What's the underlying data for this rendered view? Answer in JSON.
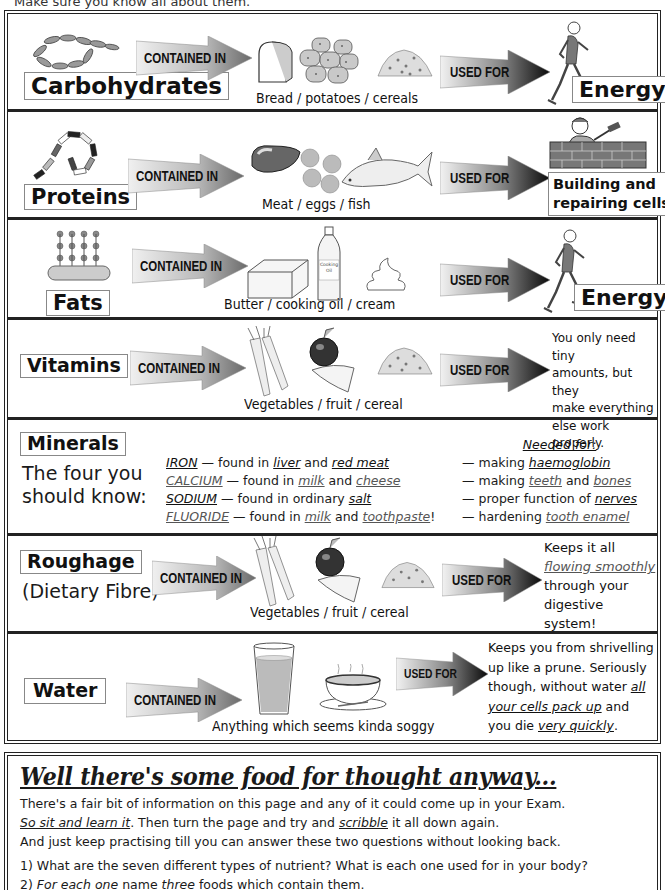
{
  "intro": "Make sure you know all about them.",
  "arrows": {
    "contained_in": "CONTAINED IN",
    "used_for": "USED FOR"
  },
  "rows": {
    "carbohydrates": {
      "name": "Carbohydrates",
      "foods": "Bread / potatoes / cereals",
      "use": "Energy",
      "icons": [
        "glucose-chain-icon",
        "bread-icon",
        "potatoes-icon",
        "cereal-icon",
        "runner-icon"
      ]
    },
    "proteins": {
      "name": "Proteins",
      "foods": "Meat / eggs / fish",
      "use_line1": "Building and",
      "use_line2": "repairing cells",
      "icons": [
        "amino-acid-chain-icon",
        "meat-icon",
        "eggs-icon",
        "fish-icon",
        "bricklayer-icon"
      ]
    },
    "fats": {
      "name": "Fats",
      "foods": "Butter / cooking oil / cream",
      "use": "Energy",
      "oil_label_1": "Cooking",
      "oil_label_2": "Oil",
      "icons": [
        "fat-molecule-icon",
        "butter-icon",
        "cooking-oil-bottle-icon",
        "cream-icon",
        "runner-icon"
      ]
    },
    "vitamins": {
      "name": "Vitamins",
      "foods": "Vegetables / fruit / cereal",
      "use_lines": [
        "You only need tiny",
        "amounts, but they",
        "make everything",
        "else work properly."
      ],
      "icons": [
        "vegetables-icon",
        "fruit-icon",
        "cereal-icon"
      ]
    },
    "minerals": {
      "name": "Minerals",
      "sub_line1": "The four you",
      "sub_line2": "should know:",
      "needed_for_heading": "Needed for:",
      "items": [
        {
          "mineral": "IRON",
          "mid": " — found in ",
          "food1": "liver",
          "and": " and ",
          "food2": "red meat",
          "end": "",
          "need_prefix": "— making ",
          "need1": "haemoglobin",
          "need_and": "",
          "need2": ""
        },
        {
          "mineral": "CALCIUM",
          "mid": " — found in ",
          "food1": "milk",
          "and": " and ",
          "food2": "cheese",
          "end": "",
          "need_prefix": "— making ",
          "need1": "teeth",
          "need_and": " and ",
          "need2": "bones"
        },
        {
          "mineral": "SODIUM",
          "mid": " — found in ordinary ",
          "food1": "salt",
          "and": "",
          "food2": "",
          "end": "",
          "need_prefix": "— proper function of ",
          "need1": "nerves",
          "need_and": "",
          "need2": ""
        },
        {
          "mineral": "FLUORIDE",
          "mid": " — found in ",
          "food1": "milk",
          "and": " and ",
          "food2": "toothpaste",
          "end": "!",
          "need_prefix": "— hardening ",
          "need1": "tooth enamel",
          "need_and": "",
          "need2": ""
        }
      ]
    },
    "roughage": {
      "name": "Roughage",
      "sub": "(Dietary Fibre)",
      "foods": "Vegetables / fruit / cereal",
      "use_line1": "Keeps it all",
      "use_line2": "flowing smoothly",
      "use_line3": "through your",
      "use_line4": "digestive system!"
    },
    "water": {
      "name": "Water",
      "foods": "Anything which seems kinda soggy",
      "use_line1": "Keeps you from shrivelling",
      "use_line2": "up like a prune.  Seriously",
      "use_line3a": "though, without water ",
      "use_line3b": "all",
      "use_line4a": "your cells pack up",
      "use_line4b": " and",
      "use_line5a": "you die ",
      "use_line5b": "very quickly",
      "use_line5c": "."
    }
  },
  "summary": {
    "title": "Well there's some food for thought anyway...",
    "line1": "There's a fair bit of information on this page and any of it could come up in your Exam.",
    "line2a": "So sit and learn it",
    "line2b": ".  Then turn the page and try and ",
    "line2c": "scribble",
    "line2d": " it all down again.",
    "line3": "And just keep practising till you can answer these two questions without looking back.",
    "q1": "1) What are the seven different types of nutrient?  What is each one used for in your body?",
    "q2a": "2) ",
    "q2b": "For each one",
    "q2c": " name ",
    "q2d": "three",
    "q2e": " foods which contain them."
  },
  "colors": {
    "border": "#222222",
    "arrow_light": "#e8e8e8",
    "arrow_dark": "#1a1a1a",
    "label_border": "#888888",
    "underline_grey": "#555555"
  }
}
